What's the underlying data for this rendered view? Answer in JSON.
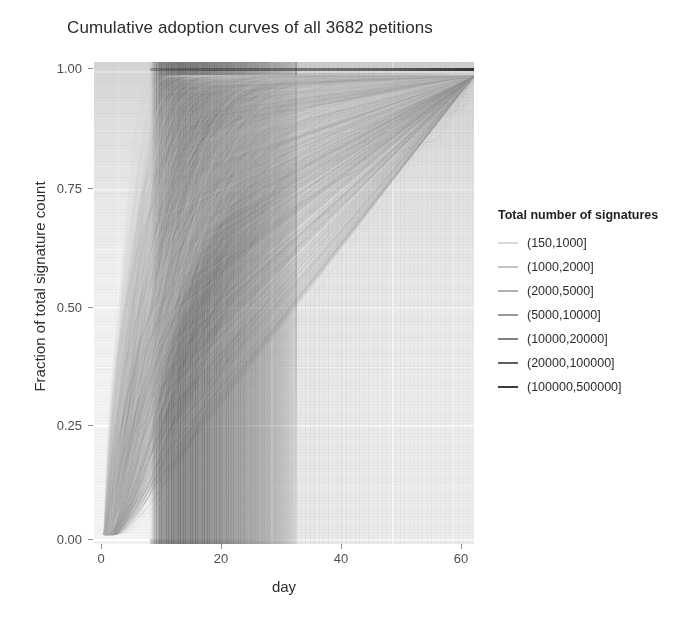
{
  "chart_data": {
    "type": "line",
    "title": "Cumulative adoption curves of all 3682 petitions",
    "xlabel": "day",
    "ylabel": "Fraction of total signature count",
    "xlim": [
      -1,
      62
    ],
    "ylim": [
      -0.02,
      1.03
    ],
    "xticks": [
      "0",
      "20",
      "40",
      "60"
    ],
    "xtick_values": [
      0,
      20,
      40,
      60
    ],
    "yticks": [
      "0.00",
      "0.25",
      "0.50",
      "0.75",
      "1.00"
    ],
    "ytick_values": [
      0.0,
      0.25,
      0.5,
      0.75,
      1.0
    ],
    "grid": true,
    "n_curves": 3682,
    "legend_position": "right",
    "panel_background": "#f3f3f3",
    "gridline_color": "#ffffff",
    "legend": {
      "title": "Total number of signatures",
      "entries": [
        {
          "label": "(150,1000]",
          "color": "#d9d9d9"
        },
        {
          "label": "(1000,2000]",
          "color": "#c6c6c6"
        },
        {
          "label": "(2000,5000]",
          "color": "#b0b0b0"
        },
        {
          "label": "(5000,10000]",
          "color": "#999999"
        },
        {
          "label": "(10000,20000]",
          "color": "#7f7f7f"
        },
        {
          "label": "(20000,100000]",
          "color": "#5f5f5f"
        },
        {
          "label": "(100000,500000]",
          "color": "#3d3d3d"
        }
      ]
    },
    "series_summary": [
      {
        "name": "(150,1000]",
        "median_day_to_half": 6,
        "deadline_day": 30
      },
      {
        "name": "(1000,2000]",
        "median_day_to_half": 6,
        "deadline_day": 30
      },
      {
        "name": "(2000,5000]",
        "median_day_to_half": 7,
        "deadline_day": 30
      },
      {
        "name": "(5000,10000]",
        "median_day_to_half": 8,
        "deadline_day": 30
      },
      {
        "name": "(10000,20000]",
        "median_day_to_half": 9,
        "deadline_day": 30
      },
      {
        "name": "(20000,100000]",
        "median_day_to_half": 10,
        "deadline_day": 30
      },
      {
        "name": "(100000,500000]",
        "median_day_to_half": 12,
        "deadline_day": 30
      }
    ]
  }
}
